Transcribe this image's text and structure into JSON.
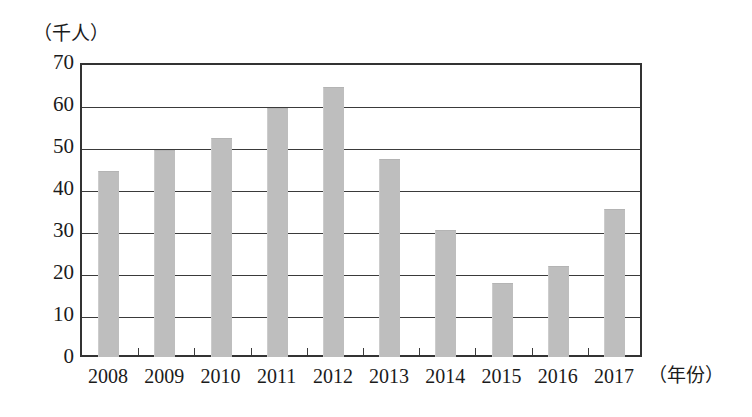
{
  "chart_data": {
    "type": "bar",
    "title": "",
    "subtitle": "",
    "xlabel": "（年份）",
    "ylabel": "（千人）",
    "categories": [
      "2008",
      "2009",
      "2010",
      "2011",
      "2012",
      "2013",
      "2014",
      "2015",
      "2016",
      "2017"
    ],
    "values": [
      44,
      49,
      52,
      59,
      64,
      47,
      30,
      17.5,
      21.5,
      35
    ],
    "ylim": [
      0,
      70
    ],
    "ytick_labels": [
      "70",
      "60",
      "50",
      "40",
      "30",
      "20",
      "10",
      "0"
    ],
    "yticks": [
      70,
      60,
      50,
      40,
      30,
      20,
      10,
      0
    ],
    "grid": true,
    "legend": false,
    "bar_color": "#bebebe",
    "axis_color": "#333333"
  }
}
